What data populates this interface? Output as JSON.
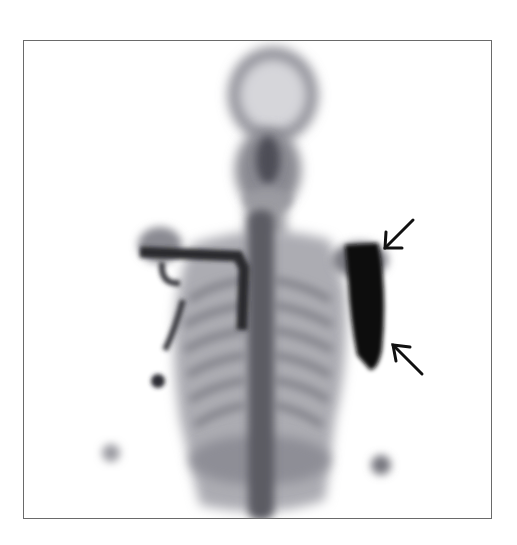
{
  "figure": {
    "type": "bone scintigraphy, anterior whole-body view (head and thorax)",
    "frame": {
      "left": 23,
      "top": 40,
      "right": 492,
      "bottom": 519,
      "border_color": "#6a6a6a"
    },
    "colors": {
      "background": "#ffffff",
      "uptake_dark": "#0a0a0a",
      "uptake_mid": "#5a5a62",
      "uptake_light": "#b8b8be",
      "arrow": "#111111"
    },
    "annotations": [
      {
        "name": "arrow-upper",
        "from": [
          413,
          220
        ],
        "to": [
          384,
          250
        ]
      },
      {
        "name": "arrow-lower",
        "from": [
          422,
          374
        ],
        "to": [
          392,
          344
        ]
      }
    ],
    "findings": {
      "intense_uptake": "left proximal humerus / shoulder region (image right)",
      "additional": "linear uptake right clavicle and lateral chest (image left)"
    }
  }
}
